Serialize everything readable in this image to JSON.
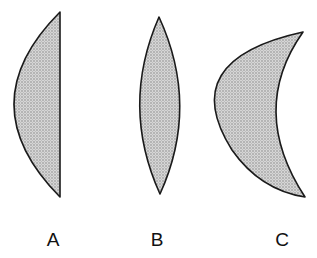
{
  "figure": {
    "colors": {
      "fill": "#c9c9c9",
      "stroke": "#1a1a1a",
      "background": "#ffffff"
    },
    "lenses": [
      {
        "label": "A",
        "shape": "plano-convex",
        "label_x": 53
      },
      {
        "label": "B",
        "shape": "biconvex",
        "label_x": 157
      },
      {
        "label": "C",
        "shape": "concavo-convex meniscus",
        "label_x": 282
      }
    ]
  }
}
